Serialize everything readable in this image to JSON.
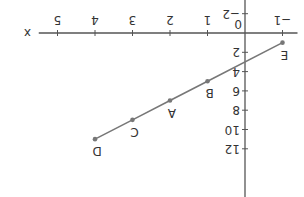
{
  "chart_data": {
    "type": "line",
    "title": "",
    "xlabel": "x",
    "ylabel": "y",
    "orientation": "rotated 180 degrees",
    "x_ticks": [
      -1,
      1,
      2,
      3,
      4,
      5
    ],
    "x_tick_labels": [
      "−1",
      "1",
      "2",
      "3",
      "4",
      "5"
    ],
    "y_ticks": [
      -2,
      2,
      4,
      6,
      8,
      10,
      12
    ],
    "y_tick_labels": [
      "−2",
      "2",
      "4",
      "6",
      "8",
      "10",
      "12"
    ],
    "origin_label": "0",
    "xlim": [
      -1.5,
      5.5
    ],
    "ylim": [
      -3,
      15
    ],
    "grid": false,
    "series": [
      {
        "name": "y = 2x + 3",
        "color": "#777777",
        "points": [
          {
            "label": "E",
            "x": -1,
            "y": 1
          },
          {
            "label": "B",
            "x": 1,
            "y": 5
          },
          {
            "label": "A",
            "x": 2,
            "y": 7
          },
          {
            "label": "C",
            "x": 3,
            "y": 9
          },
          {
            "label": "D",
            "x": 4,
            "y": 11
          }
        ]
      }
    ]
  }
}
